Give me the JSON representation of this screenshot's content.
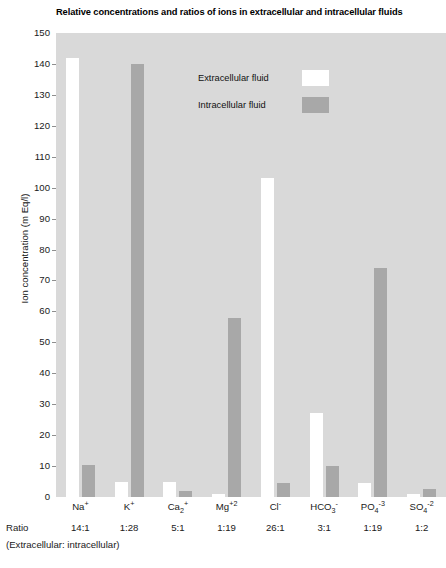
{
  "chart_data": {
    "type": "bar",
    "title": "Relative concentrations and ratios of ions in extracellular and intracellular fluids",
    "xlabel": "",
    "ylabel": "Ion concentration (m Eq/l)",
    "ylim": [
      0,
      150
    ],
    "yticks": [
      150,
      140,
      130,
      120,
      110,
      100,
      90,
      80,
      70,
      60,
      50,
      40,
      30,
      20,
      10,
      0
    ],
    "grid": false,
    "legend_position": "upper-center",
    "categories": [
      "Na+",
      "K+",
      "Ca+2",
      "Mg+2",
      "Cl-",
      "HCO3-",
      "PO4-3",
      "SO4-2"
    ],
    "series": [
      {
        "name": "Extracellular fluid",
        "color": "#ffffff",
        "values": [
          142,
          5,
          5,
          1,
          103,
          27,
          4.5,
          1
        ]
      },
      {
        "name": "Intracellular fluid",
        "color": "#a8a8a8",
        "values": [
          10.5,
          140,
          2,
          58,
          4.5,
          10,
          74,
          2.5
        ]
      }
    ],
    "ratios": [
      "14:1",
      "1:28",
      "5:1",
      "1:19",
      "26:1",
      "3:1",
      "1:19",
      "1:2"
    ]
  },
  "axis": {
    "y_title": "Ion concentration (m Eq/l)",
    "ratio_row_label": "Ratio",
    "ratio_row_sublabel": "(Extracellular: intracellular)"
  },
  "legend": {
    "items": [
      {
        "label": "Extracellular fluid",
        "swatch": "white-swatch"
      },
      {
        "label": "Intracellular fluid",
        "swatch": "gray-swatch"
      }
    ]
  },
  "x_labels": [
    {
      "ion_base": "Na",
      "ion_sup": "+",
      "ion_sub": "",
      "ratio": "14:1"
    },
    {
      "ion_base": "K",
      "ion_sup": "+",
      "ion_sub": "",
      "ratio": "1:28"
    },
    {
      "ion_base": "Ca",
      "ion_sup": "+",
      "ion_sub": "2",
      "ratio": "5:1"
    },
    {
      "ion_base": "Mg",
      "ion_sup": "+2",
      "ion_sub": "",
      "ratio": "1:19"
    },
    {
      "ion_base": "Cl",
      "ion_sup": "-",
      "ion_sub": "",
      "ratio": "26:1"
    },
    {
      "ion_base": "HCO",
      "ion_sup": "-",
      "ion_sub": "3",
      "ratio": "3:1"
    },
    {
      "ion_base": "PO",
      "ion_sup": "-3",
      "ion_sub": "4",
      "ratio": "1:19"
    },
    {
      "ion_base": "SO",
      "ion_sup": "-2",
      "ion_sub": "4",
      "ratio": "1:2"
    }
  ],
  "colors": {
    "plot_background": "#d9d9d9",
    "extracellular": "#ffffff",
    "intracellular": "#a8a8a8",
    "text": "#1a1a1a"
  }
}
